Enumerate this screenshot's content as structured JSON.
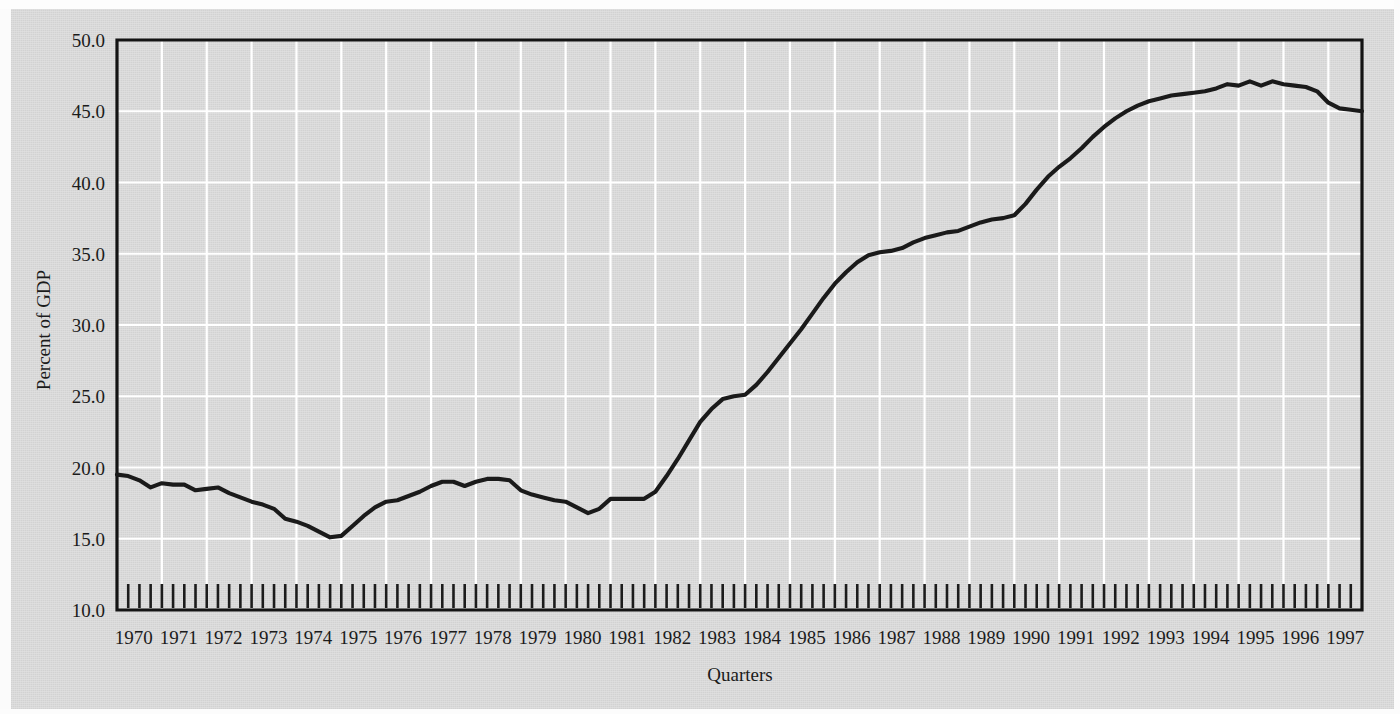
{
  "chart_data": {
    "type": "line",
    "title": "",
    "xlabel": "Quarters",
    "ylabel": "Percent of GDP",
    "ylim": [
      10.0,
      50.0
    ],
    "ytick_labels": [
      "50.0",
      "45.0",
      "40.0",
      "35.0",
      "30.0",
      "25.0",
      "20.0",
      "15.0",
      "10.0"
    ],
    "ytick_values": [
      50.0,
      45.0,
      40.0,
      35.0,
      30.0,
      25.0,
      20.0,
      15.0,
      10.0
    ],
    "grid": "horizontal and vertical white gridlines; vertical at each year, horizontal at each 5 percent",
    "legend": "none",
    "minor_ticks": "quarterly tick marks along bottom axis",
    "xtick_labels": [
      "1970",
      "1971",
      "1972",
      "1973",
      "1974",
      "1975",
      "1976",
      "1977",
      "1978",
      "1979",
      "1980",
      "1981",
      "1982",
      "1983",
      "1984",
      "1985",
      "1986",
      "1987",
      "1988",
      "1989",
      "1990",
      "1991",
      "1992",
      "1993",
      "1994",
      "1995",
      "1996",
      "1997"
    ],
    "x_quarters": [
      "1970Q1",
      "1970Q2",
      "1970Q3",
      "1970Q4",
      "1971Q1",
      "1971Q2",
      "1971Q3",
      "1971Q4",
      "1972Q1",
      "1972Q2",
      "1972Q3",
      "1972Q4",
      "1973Q1",
      "1973Q2",
      "1973Q3",
      "1973Q4",
      "1974Q1",
      "1974Q2",
      "1974Q3",
      "1974Q4",
      "1975Q1",
      "1975Q2",
      "1975Q3",
      "1975Q4",
      "1976Q1",
      "1976Q2",
      "1976Q3",
      "1976Q4",
      "1977Q1",
      "1977Q2",
      "1977Q3",
      "1977Q4",
      "1978Q1",
      "1978Q2",
      "1978Q3",
      "1978Q4",
      "1979Q1",
      "1979Q2",
      "1979Q3",
      "1979Q4",
      "1980Q1",
      "1980Q2",
      "1980Q3",
      "1980Q4",
      "1981Q1",
      "1981Q2",
      "1981Q3",
      "1981Q4",
      "1982Q1",
      "1982Q2",
      "1982Q3",
      "1982Q4",
      "1983Q1",
      "1983Q2",
      "1983Q3",
      "1983Q4",
      "1984Q1",
      "1984Q2",
      "1984Q3",
      "1984Q4",
      "1985Q1",
      "1985Q2",
      "1985Q3",
      "1985Q4",
      "1986Q1",
      "1986Q2",
      "1986Q3",
      "1986Q4",
      "1987Q1",
      "1987Q2",
      "1987Q3",
      "1987Q4",
      "1988Q1",
      "1988Q2",
      "1988Q3",
      "1988Q4",
      "1989Q1",
      "1989Q2",
      "1989Q3",
      "1989Q4",
      "1990Q1",
      "1990Q2",
      "1990Q3",
      "1990Q4",
      "1991Q1",
      "1991Q2",
      "1991Q3",
      "1991Q4",
      "1992Q1",
      "1992Q2",
      "1992Q3",
      "1992Q4",
      "1993Q1",
      "1993Q2",
      "1993Q3",
      "1993Q4",
      "1994Q1",
      "1994Q2",
      "1994Q3",
      "1994Q4",
      "1995Q1",
      "1995Q2",
      "1995Q3",
      "1995Q4",
      "1996Q1",
      "1996Q2",
      "1996Q3",
      "1996Q4",
      "1997Q1",
      "1997Q2",
      "1997Q3",
      "1997Q4"
    ],
    "values": [
      19.5,
      19.4,
      19.1,
      18.6,
      18.9,
      18.8,
      18.8,
      18.4,
      18.5,
      18.6,
      18.2,
      17.9,
      17.6,
      17.4,
      17.1,
      16.4,
      16.2,
      15.9,
      15.5,
      15.1,
      15.2,
      15.9,
      16.6,
      17.2,
      17.6,
      17.7,
      18.0,
      18.3,
      18.7,
      19.0,
      19.0,
      18.7,
      19.0,
      19.2,
      19.2,
      19.1,
      18.4,
      18.1,
      17.9,
      17.7,
      17.6,
      17.2,
      16.8,
      17.1,
      17.8,
      17.8,
      17.8,
      17.8,
      18.3,
      19.4,
      20.6,
      21.9,
      23.2,
      24.1,
      24.8,
      25.0,
      25.1,
      25.8,
      26.7,
      27.7,
      28.7,
      29.7,
      30.8,
      31.9,
      32.9,
      33.7,
      34.4,
      34.9,
      35.1,
      35.2,
      35.4,
      35.8,
      36.1,
      36.3,
      36.5,
      36.6,
      36.9,
      37.2,
      37.4,
      37.5,
      37.7,
      38.5,
      39.5,
      40.4,
      41.1,
      41.7,
      42.4,
      43.2,
      43.9,
      44.5,
      45.0,
      45.4,
      45.7,
      45.9,
      46.1,
      46.2,
      46.3,
      46.4,
      46.6,
      46.9,
      46.8,
      47.1,
      46.8,
      47.1,
      46.9,
      46.8,
      46.7,
      46.4,
      45.6,
      45.2,
      45.1,
      45.0
    ],
    "series_color": "#1a1a1a",
    "background_color": "#d2d2d2",
    "gridline_color": "#ffffff",
    "annotations": [],
    "notes": {
      "start_value": 19.5,
      "minimum_value": 15.1,
      "minimum_at": "1974Q4",
      "maximum_value": 47.1,
      "maximum_at": "1995Q4",
      "end_value": 45.0
    }
  }
}
